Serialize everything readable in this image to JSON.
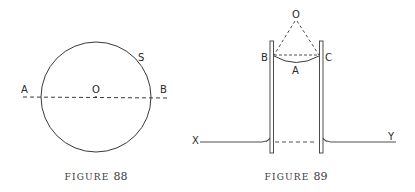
{
  "figure88": {
    "caption_word": "FIGURE",
    "caption_number": "88",
    "labels": {
      "A": "A",
      "O": "O",
      "B": "B",
      "S": "S"
    }
  },
  "figure89": {
    "caption_word": "FIGURE",
    "caption_number": "89",
    "labels": {
      "O": "O",
      "B": "B",
      "C": "C",
      "A": "A",
      "X": "X",
      "Y": "Y"
    }
  },
  "colors": {
    "ink": "#2a2a2a",
    "background": "#ffffff"
  }
}
